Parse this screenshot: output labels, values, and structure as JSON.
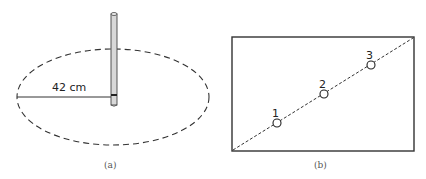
{
  "figure_a": {
    "caption": "(a)",
    "measurement_label": "42 cm"
  },
  "figure_b": {
    "caption": "(b)",
    "points": [
      {
        "label": "1"
      },
      {
        "label": "2"
      },
      {
        "label": "3"
      }
    ]
  }
}
